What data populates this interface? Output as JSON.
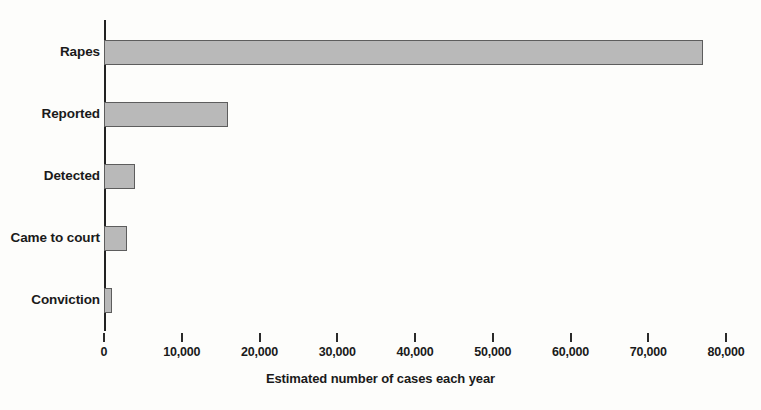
{
  "chart_data": {
    "type": "bar",
    "orientation": "horizontal",
    "title": "",
    "subtitle": "",
    "xlabel": "Estimated number of cases each year",
    "ylabel": "",
    "categories": [
      "Rapes",
      "Reported",
      "Detected",
      "Came to court",
      "Conviction"
    ],
    "values": [
      77000,
      16000,
      4000,
      3000,
      1000
    ],
    "series": [
      {
        "name": "Estimated number of cases each year",
        "values": [
          77000,
          16000,
          4000,
          3000,
          1000
        ]
      }
    ],
    "xlim": [
      0,
      80000
    ],
    "ylim": null,
    "xticks": [
      0,
      10000,
      20000,
      30000,
      40000,
      50000,
      60000,
      70000,
      80000
    ],
    "xticklabels": [
      "0",
      "10,000",
      "20,000",
      "30,000",
      "40,000",
      "50,000",
      "60,000",
      "70,000",
      "80,000"
    ],
    "grid": false,
    "legend": false,
    "legend_position": "none",
    "bar_fill_color": "#b9b9b9",
    "bar_edge_color": "#5d5d5d",
    "axis_color": "#222222",
    "background_color": "#fdfdfb",
    "text_color": "#1a1a1a",
    "annotations": []
  },
  "axis": {
    "x_title": "Estimated number of cases each year"
  }
}
